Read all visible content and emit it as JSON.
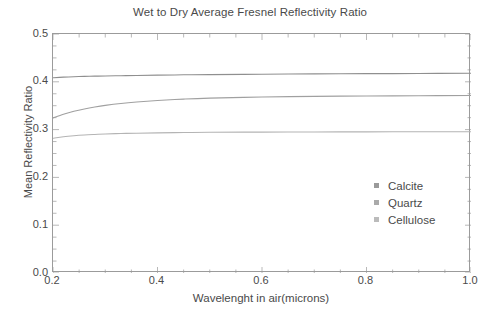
{
  "chart_data": {
    "type": "line",
    "title": "Wet to Dry Average Fresnel Reflectivity Ratio",
    "xlabel": "Wavelenght in air(microns)",
    "ylabel": "Mean Reflectivity Ratio",
    "xlim": [
      0.2,
      1.0
    ],
    "ylim": [
      0.0,
      0.5
    ],
    "xticks": [
      "0.2",
      "0.4",
      "0.6",
      "0.8",
      "1.0"
    ],
    "xtick_values": [
      0.2,
      0.4,
      0.6,
      0.8,
      1.0
    ],
    "yticks": [
      "0.0",
      "0.1",
      "0.2",
      "0.3",
      "0.4",
      "0.5"
    ],
    "ytick_values": [
      0.0,
      0.1,
      0.2,
      0.3,
      0.4,
      0.5
    ],
    "grid": false,
    "legend_position": "center-right",
    "x": [
      0.2,
      0.22,
      0.24,
      0.26,
      0.28,
      0.3,
      0.33,
      0.36,
      0.4,
      0.45,
      0.5,
      0.6,
      0.7,
      0.8,
      0.9,
      1.0
    ],
    "series": [
      {
        "name": "Calcite",
        "color": "#8f8f8f",
        "values": [
          0.4085,
          0.4098,
          0.4107,
          0.4113,
          0.4118,
          0.4122,
          0.4128,
          0.4133,
          0.4139,
          0.4146,
          0.4151,
          0.4159,
          0.4165,
          0.417,
          0.4174,
          0.4178
        ]
      },
      {
        "name": "Quartz",
        "color": "#a0a0a0",
        "values": [
          0.3245,
          0.332,
          0.3382,
          0.3432,
          0.3473,
          0.3507,
          0.3547,
          0.3577,
          0.3608,
          0.3638,
          0.3658,
          0.3682,
          0.3695,
          0.3703,
          0.3709,
          0.3713
        ]
      },
      {
        "name": "Cellulose",
        "color": "#b4b4b4",
        "values": [
          0.2818,
          0.285,
          0.2872,
          0.2888,
          0.2899,
          0.2908,
          0.2918,
          0.2925,
          0.2932,
          0.2939,
          0.2943,
          0.2948,
          0.2951,
          0.2953,
          0.2955,
          0.2956
        ]
      }
    ]
  },
  "axes": {
    "y_tick_labels": [
      "0.5",
      "0.4",
      "0.3",
      "0.2",
      "0.1",
      "0.0"
    ],
    "x_tick_labels": [
      "0.2",
      "0.4",
      "0.6",
      "0.8",
      "1.0"
    ]
  },
  "legend": {
    "items": [
      {
        "label": "Calcite",
        "color": "#9a9a9a"
      },
      {
        "label": "Quartz",
        "color": "#aaaaaa"
      },
      {
        "label": "Cellulose",
        "color": "#bbbbbb"
      }
    ]
  }
}
